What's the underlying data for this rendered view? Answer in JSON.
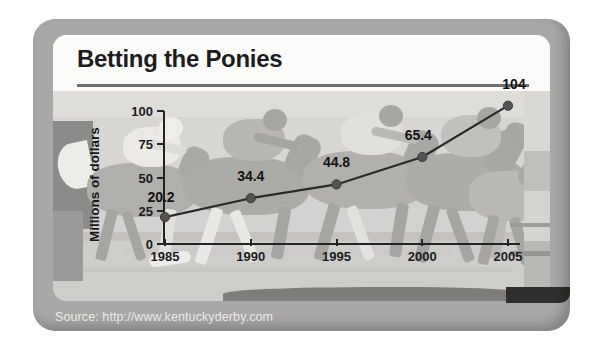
{
  "chart_title": "Betting the Ponies",
  "source": "Source: http://www.kentuckyderby.com",
  "chart_data": {
    "type": "line",
    "title": "Betting the Ponies",
    "xlabel": "",
    "ylabel": "Millions of dollars",
    "categories": [
      "1985",
      "1990",
      "1995",
      "2000",
      "2005"
    ],
    "values": [
      20.2,
      34.4,
      44.8,
      65.4,
      104
    ],
    "point_labels": [
      "20.2",
      "34.4",
      "44.8",
      "65.4",
      "104"
    ],
    "ylim": [
      0,
      100
    ],
    "yticks": [
      "0",
      "25",
      "50",
      "75",
      "100"
    ],
    "ytick_values": [
      0,
      25,
      50,
      75,
      100
    ],
    "xticks": [
      "1985",
      "1990",
      "1995",
      "2000",
      "2005"
    ],
    "grid": false,
    "legend": "none",
    "series_color": "#2a2a2a",
    "marker_color": "#555452",
    "background_image": "grayscale-photo-of-racing-horses-with-jockeys"
  },
  "colors": {
    "frame": "#a8a8a8",
    "card": "#f2f1ef",
    "title_text": "#1d1d1d",
    "rule": "#6f6f6f",
    "axis": "#232323",
    "source_text": "#efeeec"
  }
}
